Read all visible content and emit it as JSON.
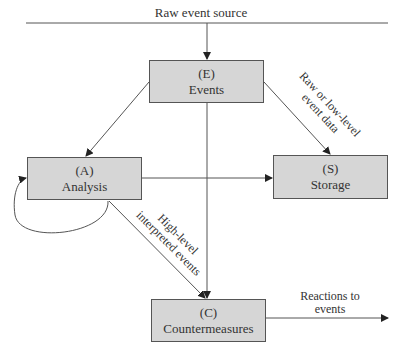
{
  "diagram": {
    "source_label": "Raw event source",
    "nodes": {
      "events": {
        "id": "(E)",
        "label": "Events"
      },
      "analysis": {
        "id": "(A)",
        "label": "Analysis"
      },
      "storage": {
        "id": "(S)",
        "label": "Storage"
      },
      "countermeasures": {
        "id": "(C)",
        "label": "Countermeasures"
      }
    },
    "edge_labels": {
      "raw_data_line1": "Raw or low-level",
      "raw_data_line2": "event data",
      "high_level_line1": "High-level",
      "high_level_line2": "interpreted events",
      "reactions_line1": "Reactions to",
      "reactions_line2": "events"
    },
    "colors": {
      "box_fill": "#d6d6d6",
      "line": "#444444"
    }
  }
}
